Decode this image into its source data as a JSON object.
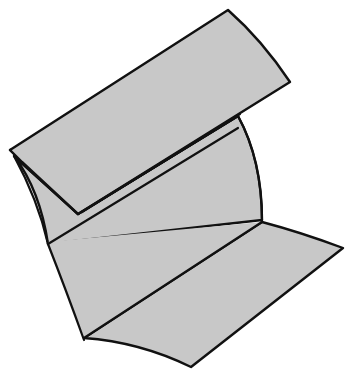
{
  "figure": {
    "colors": {
      "fill": "#c8c8c8",
      "stroke": "#111111",
      "background": "#ffffff"
    },
    "panels": [
      {
        "name": "top-flap"
      },
      {
        "name": "middle-panel"
      },
      {
        "name": "bottom-flap"
      }
    ]
  }
}
